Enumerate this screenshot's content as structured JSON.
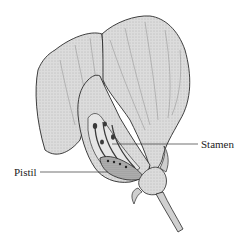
{
  "diagram": {
    "labels": [
      {
        "id": "stamen",
        "text": "Stamen"
      },
      {
        "id": "pistil",
        "text": "Pistil"
      }
    ]
  },
  "colors": {
    "background": "#ffffff",
    "petal_fill": "#d8d8d8",
    "petal_shade": "#bdbdbd",
    "outline": "#2a2a2a",
    "interior_dark": "#3a3a3a",
    "leader_line": "#333333"
  }
}
